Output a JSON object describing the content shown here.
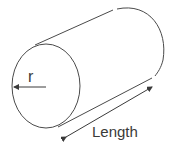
{
  "diagram": {
    "labels": {
      "radius": "r",
      "length": "Length"
    },
    "colors": {
      "stroke": "#4a4a4a",
      "text": "#3a3a3a",
      "background": "#ffffff"
    }
  }
}
